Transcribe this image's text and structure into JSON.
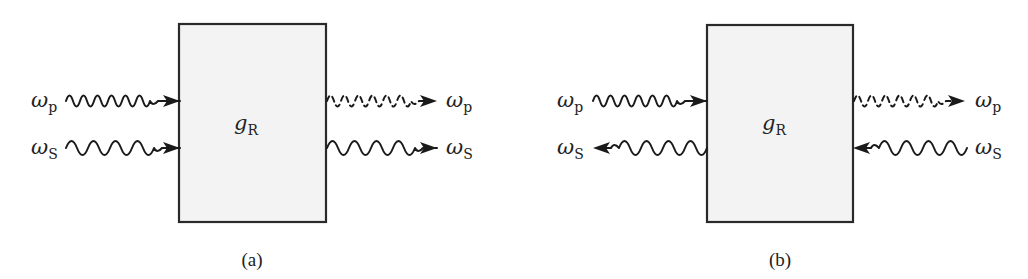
{
  "figure": {
    "panels": [
      {
        "id": "a",
        "caption": "(a)",
        "medium_label": {
          "symbol": "g",
          "subscript": "R"
        },
        "box": {
          "x": 179,
          "y": 24,
          "width": 147,
          "height": 198
        },
        "beams": [
          {
            "name": "pump-input",
            "symbol": "ω",
            "subscript": "p",
            "direction": "forward",
            "side": "left",
            "style": "solid",
            "cycles": 6,
            "y": 101
          },
          {
            "name": "stokes-input",
            "symbol": "ω",
            "subscript": "S",
            "direction": "forward",
            "side": "left",
            "style": "solid",
            "cycles": 4,
            "y": 148
          },
          {
            "name": "pump-output",
            "symbol": "ω",
            "subscript": "p",
            "direction": "forward",
            "side": "right",
            "style": "dashed",
            "cycles": 6,
            "y": 101
          },
          {
            "name": "stokes-output",
            "symbol": "ω",
            "subscript": "S",
            "direction": "forward",
            "side": "right",
            "style": "solid",
            "cycles": 4,
            "y": 148
          }
        ]
      },
      {
        "id": "b",
        "caption": "(b)",
        "medium_label": {
          "symbol": "g",
          "subscript": "R"
        },
        "box": {
          "x": 707,
          "y": 25,
          "width": 146,
          "height": 197
        },
        "beams": [
          {
            "name": "pump-input",
            "symbol": "ω",
            "subscript": "p",
            "direction": "forward",
            "side": "left",
            "style": "solid",
            "cycles": 6,
            "y": 101
          },
          {
            "name": "stokes-output",
            "symbol": "ω",
            "subscript": "S",
            "direction": "backward",
            "side": "left",
            "style": "solid",
            "cycles": 4,
            "y": 148
          },
          {
            "name": "pump-output",
            "symbol": "ω",
            "subscript": "p",
            "direction": "forward",
            "side": "right",
            "style": "dashed",
            "cycles": 6,
            "y": 101
          },
          {
            "name": "stokes-input",
            "symbol": "ω",
            "subscript": "S",
            "direction": "backward",
            "side": "right",
            "style": "solid",
            "cycles": 4,
            "y": 148
          }
        ]
      }
    ],
    "colors": {
      "box_fill": "#f3f3f3",
      "stroke": "#1a1a1a",
      "text": "#222222",
      "background": "#ffffff"
    }
  },
  "labels": {
    "a": {
      "caption": "(a)",
      "gain_symbol": "g",
      "gain_sub": "R",
      "left_pump_symbol": "ω",
      "left_pump_sub": "p",
      "left_stokes_symbol": "ω",
      "left_stokes_sub": "S",
      "right_pump_symbol": "ω",
      "right_pump_sub": "p",
      "right_stokes_symbol": "ω",
      "right_stokes_sub": "S"
    },
    "b": {
      "caption": "(b)",
      "gain_symbol": "g",
      "gain_sub": "R",
      "left_pump_symbol": "ω",
      "left_pump_sub": "p",
      "left_stokes_symbol": "ω",
      "left_stokes_sub": "S",
      "right_pump_symbol": "ω",
      "right_pump_sub": "p",
      "right_stokes_symbol": "ω",
      "right_stokes_sub": "S"
    }
  }
}
